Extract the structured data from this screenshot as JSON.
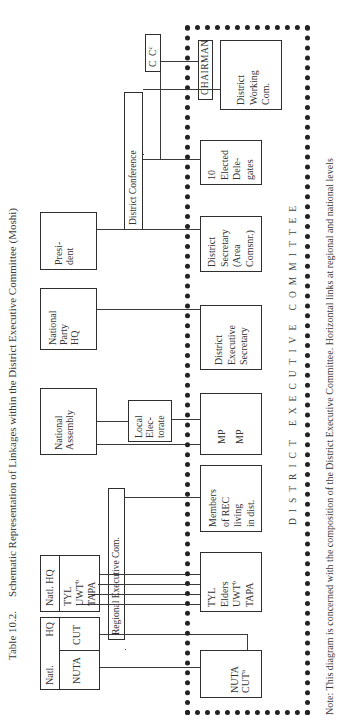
{
  "title": {
    "number": "Table 10.2.",
    "text": "Schematic Representation of Linkages within the District Executive Committee (Moshi)"
  },
  "national_level": {
    "natl_box": {
      "top_left": "Natl.",
      "top_right": "HQ",
      "left": "NUTA",
      "right": "CUT"
    },
    "natl_hq_box": {
      "header": "Natl. HQ",
      "items": [
        "TYL",
        "UWT",
        "TAPA"
      ],
      "uwt_sup": "b"
    },
    "national_assembly": [
      "National",
      "Assembly"
    ],
    "national_party_hq": [
      "National",
      "Party",
      "HQ"
    ],
    "president": [
      "Presi-",
      "dent"
    ]
  },
  "intermediate_level": {
    "regional_executive_com": "Regional Executive Com.",
    "local_electorate": [
      "Local",
      "Elec-",
      "torate"
    ],
    "district_conference": "District Conference",
    "cc": {
      "label": "C",
      "sup": "C",
      "sup2": "c"
    }
  },
  "district_executive_committee": {
    "label": "DISTRICT EXECUTIVE COMMITTEE",
    "nuta_cut": {
      "lines": [
        "NUTA",
        "CUT"
      ],
      "cut_sup": "a"
    },
    "mass_orgs": {
      "items": [
        "TYL",
        "Elders",
        "UWT",
        "TAPA"
      ],
      "uwt_sup": "b"
    },
    "members_of_rec": [
      "Members",
      "of REC",
      "living",
      "in dist."
    ],
    "mp": [
      "MP",
      "MP"
    ],
    "district_exec_secretary": [
      "District",
      "Executive",
      "Secretary"
    ],
    "district_secretary": [
      "District",
      "Secretary",
      "(Area",
      "Comsnr.)"
    ],
    "elected_delegates": [
      "10",
      "Elected",
      "Dele-",
      "gates"
    ],
    "chairman": "CHAIRMAN",
    "district_working_com": [
      "District",
      "Working",
      "Com."
    ]
  },
  "note": "Note: This diagram is concerned with the composition of the District Executive Committee.  Horizontal links at regional and national levels"
}
